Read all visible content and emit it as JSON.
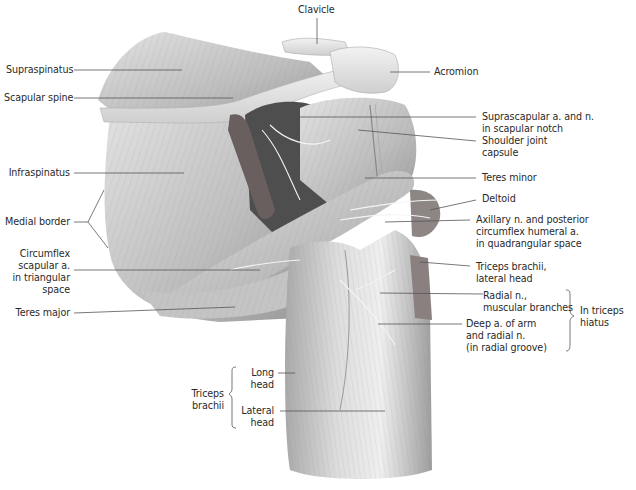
{
  "figure": {
    "palette": {
      "background": "#ffffff",
      "muscle_light": "#d9d9d9",
      "muscle_mid": "#b4b4b4",
      "muscle_dark": "#7a7a7a",
      "bone": "#e6e6e6",
      "cavity": "#4a4a4a",
      "text": "#2a2a2a",
      "leader": "#555555"
    }
  },
  "labels": {
    "clavicle": {
      "lines": [
        "Clavicle"
      ]
    },
    "acromion": {
      "lines": [
        "Acromion"
      ]
    },
    "supraspinatus": {
      "lines": [
        "Supraspinatus"
      ]
    },
    "scapular_spine": {
      "lines": [
        "Scapular spine"
      ]
    },
    "suprascapular": {
      "lines": [
        "Suprascapular a. and n.",
        "in scapular notch"
      ]
    },
    "shoulder_capsule": {
      "lines": [
        "Shoulder joint",
        "capsule"
      ]
    },
    "infraspinatus": {
      "lines": [
        "Infraspinatus"
      ]
    },
    "teres_minor": {
      "lines": [
        "Teres minor"
      ]
    },
    "deltoid": {
      "lines": [
        "Deltoid"
      ]
    },
    "medial_border": {
      "lines": [
        "Medial border"
      ]
    },
    "axillary": {
      "lines": [
        "Axillary n. and posterior",
        "circumflex humeral a.",
        "in quadrangular space"
      ]
    },
    "circumflex_scapular": {
      "lines": [
        "Circumflex",
        "scapular a.",
        "in triangular",
        "space"
      ]
    },
    "triceps_lateral_head_top": {
      "lines": [
        "Triceps brachii,",
        "lateral head"
      ]
    },
    "radial_branches": {
      "lines": [
        "Radial n.,",
        "muscular branches"
      ]
    },
    "teres_major": {
      "lines": [
        "Teres major"
      ]
    },
    "deep_artery": {
      "lines": [
        "Deep a. of arm",
        "and radial n.",
        "(in radial groove)"
      ]
    },
    "triceps_hiatus": {
      "lines": [
        "In triceps",
        "hiatus"
      ]
    },
    "triceps_brachii_group": {
      "lines": [
        "Triceps",
        "brachii"
      ]
    },
    "long_head": {
      "lines": [
        "Long",
        "head"
      ]
    },
    "lateral_head": {
      "lines": [
        "Lateral",
        "head"
      ]
    }
  }
}
